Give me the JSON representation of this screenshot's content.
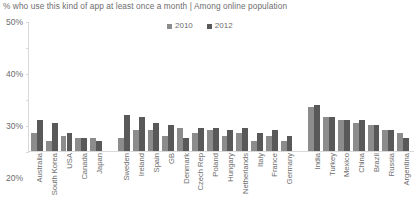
{
  "chart_data": {
    "type": "bar",
    "title": "% who use this kind of app at least once a month | Among online population",
    "xlabel": "",
    "ylabel": "",
    "ylim": [
      0,
      50
    ],
    "ytick_labels": [
      "50%",
      "40%",
      "30%",
      "20%",
      "10%",
      "0%"
    ],
    "ytick_values": [
      50,
      40,
      30,
      20,
      10,
      0
    ],
    "grid": false,
    "legend_position": "top-center",
    "categories": [
      "Australia",
      "South Korea",
      "USA",
      "Canada",
      "Japan",
      "Sweden",
      "Ireland",
      "Spain",
      "GB",
      "Denmark",
      "Czech Rep",
      "Poland",
      "Hungary",
      "Netherlands",
      "Italy",
      "France",
      "Germany",
      "India",
      "Turkey",
      "Mexico",
      "China",
      "Brazil",
      "Russia",
      "Argentina"
    ],
    "group_breaks": [
      5,
      17
    ],
    "series": [
      {
        "name": "2010",
        "color": "#8c8c8c",
        "values": [
          7,
          4,
          6,
          5,
          5,
          5,
          8,
          8,
          6,
          9,
          7,
          8,
          6,
          7,
          4,
          6,
          4,
          17,
          13,
          12,
          11,
          10,
          8,
          7
        ]
      },
      {
        "name": "2012",
        "color": "#595959",
        "values": [
          12,
          11,
          7,
          5,
          4,
          14,
          13,
          11,
          10,
          5,
          9,
          9,
          8,
          9,
          7,
          8,
          6,
          18,
          13,
          12,
          12,
          10,
          8,
          5
        ]
      }
    ]
  },
  "legend": {
    "items": [
      {
        "label": "2010",
        "color": "#8c8c8c"
      },
      {
        "label": "2012",
        "color": "#595959"
      }
    ]
  }
}
